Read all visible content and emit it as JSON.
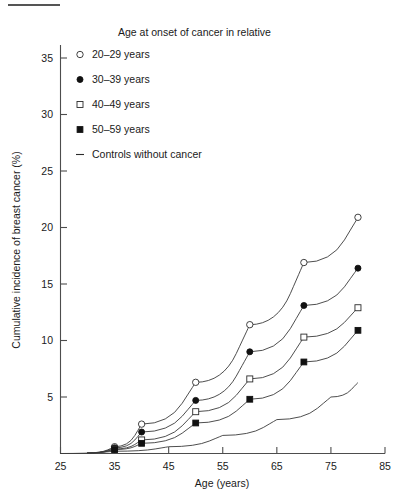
{
  "figure": {
    "top_rule": "horizontal-rule"
  },
  "legend": {
    "title": "Age at onset of cancer in relative",
    "entries": [
      {
        "label": "20–29 years",
        "marker": "open-circle"
      },
      {
        "label": "30–39 years",
        "marker": "filled-circle"
      },
      {
        "label": "40–49 years",
        "marker": "open-square"
      },
      {
        "label": "50–59 years",
        "marker": "filled-square"
      },
      {
        "label": "Controls without cancer",
        "marker": "dash"
      }
    ]
  },
  "axes": {
    "x_title": "Age (years)",
    "y_title": "Cumulative incidence of breast cancer (%)",
    "x_ticks": [
      "25",
      "35",
      "45",
      "55",
      "65",
      "75",
      "85"
    ],
    "y_ticks": [
      "5",
      "10",
      "15",
      "20",
      "25",
      "30",
      "35"
    ]
  },
  "chart_data": {
    "type": "line",
    "title": "",
    "subtitle": "",
    "xlabel": "Age (years)",
    "ylabel": "Cumulative incidence of breast cancer (%)",
    "xlim": [
      25,
      85
    ],
    "ylim": [
      0,
      37
    ],
    "x_ticks": [
      25,
      35,
      45,
      55,
      65,
      75,
      85
    ],
    "y_ticks": [
      5,
      10,
      15,
      20,
      25,
      30,
      35
    ],
    "grid": false,
    "legend_position": "top-center",
    "legend_title": "Age at onset of cancer in relative",
    "x": [
      30,
      35,
      40,
      50,
      60,
      70,
      80
    ],
    "series": [
      {
        "name": "20–29 years",
        "marker": "open-circle",
        "x": [
          35,
          40,
          50,
          60,
          70,
          80
        ],
        "values": [
          0.6,
          2.6,
          6.3,
          11.4,
          16.9,
          20.9
        ]
      },
      {
        "name": "30–39 years",
        "marker": "filled-circle",
        "x": [
          35,
          40,
          50,
          60,
          70,
          80
        ],
        "values": [
          0.5,
          1.9,
          4.7,
          9.0,
          13.1,
          16.4
        ]
      },
      {
        "name": "40–49 years",
        "marker": "open-square",
        "x": [
          35,
          40,
          50,
          60,
          70,
          80
        ],
        "values": [
          0.4,
          1.2,
          3.7,
          6.6,
          10.3,
          12.9
        ]
      },
      {
        "name": "50–59 years",
        "marker": "filled-square",
        "x": [
          35,
          40,
          50,
          60,
          70,
          80
        ],
        "values": [
          0.35,
          0.9,
          2.7,
          4.8,
          8.1,
          10.9
        ]
      },
      {
        "name": "Controls without cancer",
        "marker": "none",
        "x": [
          25,
          35,
          45,
          55,
          65,
          75,
          80
        ],
        "values": [
          0.0,
          0.2,
          0.6,
          1.6,
          3.0,
          5.0,
          6.3
        ]
      }
    ]
  }
}
